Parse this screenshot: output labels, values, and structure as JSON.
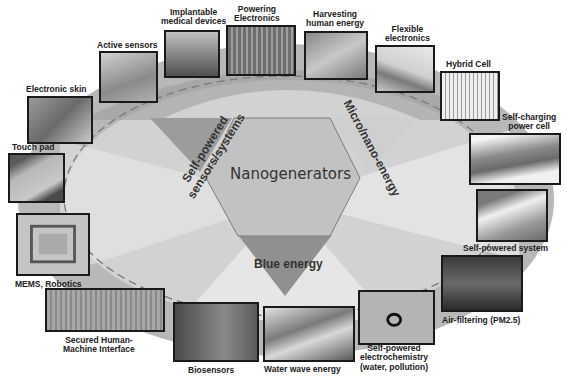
{
  "diagram": {
    "center": "Nanogenerators",
    "themes": {
      "left": [
        "Self-powered",
        "sensors/systems"
      ],
      "right": "Micro/nano-energy",
      "bottom": "Blue energy"
    },
    "applications": [
      {
        "id": "electronic-skin",
        "label": [
          "Electronic skin"
        ],
        "image": "close-up of skin"
      },
      {
        "id": "active-sensors",
        "label": [
          "Active sensors"
        ],
        "image": "hand touching sensor"
      },
      {
        "id": "implantable-medical-devices",
        "label": [
          "Implantable",
          "medical devices"
        ],
        "image": "animal implant"
      },
      {
        "id": "powering-electronics",
        "label": [
          "Powering",
          "Electronics"
        ],
        "image": "LED arrays"
      },
      {
        "id": "harvesting-human-energy",
        "label": [
          "Harvesting",
          "human energy"
        ],
        "image": "hands with device"
      },
      {
        "id": "flexible-electronics",
        "label": [
          "Flexible",
          "electronics"
        ],
        "image": "flexible film"
      },
      {
        "id": "hybrid-cell",
        "label": [
          "Hybrid Cell"
        ],
        "image": "nanowire hybrid cell schematic"
      },
      {
        "id": "self-charging-power-cell",
        "label": [
          "Self-charging",
          "power cell"
        ],
        "image": "layered power cell"
      },
      {
        "id": "self-powered-system",
        "label": [
          "Self-powered system"
        ],
        "image": "shoe with device"
      },
      {
        "id": "air-filtering",
        "label": [
          "Air-filtering (PM2.5)"
        ],
        "image": "car exhaust"
      },
      {
        "id": "self-powered-electrochemistry",
        "label": [
          "Self-powered",
          "electrochemistry",
          "(water, pollution)"
        ],
        "image": "electrochemistry setup"
      },
      {
        "id": "water-wave-energy",
        "label": [
          "Water wave energy"
        ],
        "image": "ocean wave"
      },
      {
        "id": "biosensors",
        "label": [
          "Biosensors"
        ],
        "image": "biosensor devices"
      },
      {
        "id": "secured-hmi",
        "label": [
          "Secured Human-",
          "Machine Interface"
        ],
        "image": "keyboard"
      },
      {
        "id": "mems-robotics",
        "label": [
          "MEMS, Robotics"
        ],
        "image": "MEMS chip"
      },
      {
        "id": "touch-pad",
        "label": [
          "Touch pad"
        ],
        "image": "finger on pad"
      }
    ]
  }
}
